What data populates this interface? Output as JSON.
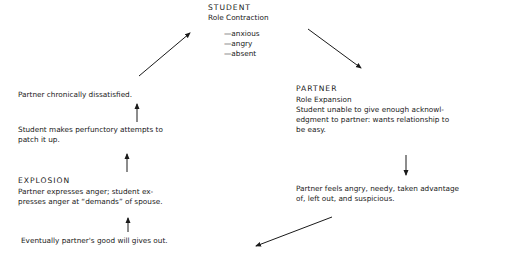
{
  "diagram": {
    "type": "cycle",
    "student": {
      "title": "STUDENT",
      "subtitle": "Role Contraction",
      "traits": [
        "—anxious",
        "—angry",
        "—absent"
      ]
    },
    "partner": {
      "title": "PARTNER",
      "subtitle": "Role Expansion",
      "lines": [
        "Student unable to give enough acknowl-",
        "edgment to partner:  wants relationship to",
        "be easy."
      ]
    },
    "partner_feels": {
      "lines": [
        "Partner feels angry, needy, taken advantage",
        "of, left out, and suspicious."
      ]
    },
    "good_will": {
      "text": "Eventually partner's good will gives out."
    },
    "explosion": {
      "title": "EXPLOSION",
      "lines": [
        "Partner expresses anger; student ex-",
        "presses anger at “demands” of spouse."
      ]
    },
    "perfunctory": {
      "lines": [
        "Student makes perfunctory attempts to",
        "patch it up."
      ]
    },
    "dissatisfied": {
      "text": "Partner chronically dissatisfied."
    },
    "arrow_color": "#1a1a1a"
  }
}
